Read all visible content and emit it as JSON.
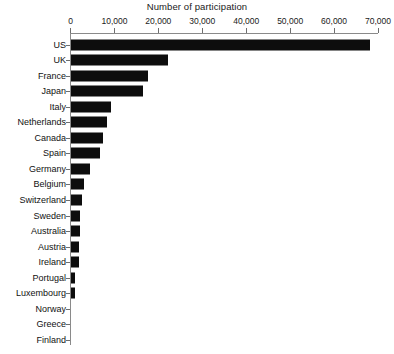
{
  "chart_data": {
    "type": "bar",
    "orientation": "horizontal",
    "title": "Number of participation",
    "xlabel": "",
    "ylabel": "",
    "xlim": [
      0,
      70000
    ],
    "grid": false,
    "legend": null,
    "xticks": [
      {
        "value": 0,
        "label": "0"
      },
      {
        "value": 10000,
        "label": "10,000"
      },
      {
        "value": 20000,
        "label": "20,000"
      },
      {
        "value": 30000,
        "label": "30,000"
      },
      {
        "value": 40000,
        "label": "40,000"
      },
      {
        "value": 50000,
        "label": "50,000"
      },
      {
        "value": 60000,
        "label": "60,000"
      },
      {
        "value": 70000,
        "label": "70,000"
      }
    ],
    "categories": [
      "US",
      "UK",
      "France",
      "Japan",
      "Italy",
      "Netherlands",
      "Canada",
      "Spain",
      "Germany",
      "Belgium",
      "Switzerland",
      "Sweden",
      "Australia",
      "Austria",
      "Ireland",
      "Portugal",
      "Luxembourg",
      "Norway",
      "Greece",
      "Finland"
    ],
    "values": [
      68000,
      22000,
      17500,
      16500,
      9000,
      8300,
      7200,
      6700,
      4300,
      3000,
      2600,
      2100,
      2000,
      1900,
      1800,
      800,
      800,
      0,
      0,
      0
    ],
    "bar_color": "#0d0d0d",
    "axis_color": "#8a8a8a",
    "background_color": "#ffffff"
  }
}
